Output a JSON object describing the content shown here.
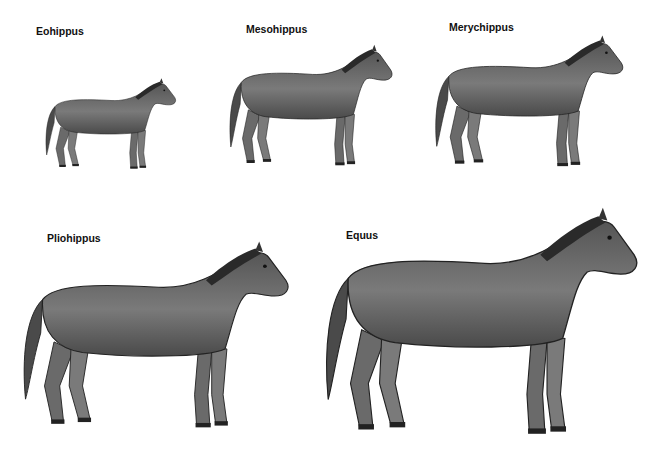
{
  "species": [
    {
      "name": "Eohippus",
      "label_x": 36,
      "label_y": 25
    },
    {
      "name": "Mesohippus",
      "label_x": 246,
      "label_y": 23
    },
    {
      "name": "Merychippus",
      "label_x": 449,
      "label_y": 21
    },
    {
      "name": "Pliohippus",
      "label_x": 47,
      "label_y": 232
    },
    {
      "name": "Equus",
      "label_x": 346,
      "label_y": 229
    }
  ],
  "colors": {
    "body": "#6e6e6e",
    "dark": "#3a3a3a",
    "light": "#a8a8a8",
    "background": "#ffffff"
  }
}
